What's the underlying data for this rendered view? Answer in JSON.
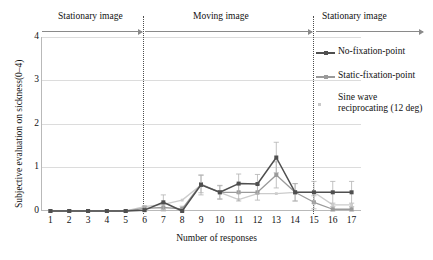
{
  "axes": {
    "ylabel": "Subjective evaluation on sickness(0–4)",
    "xlabel": "Number of responses",
    "yticks": [
      "0",
      "1",
      "2",
      "3",
      "4"
    ],
    "xticks": [
      "1",
      "2",
      "3",
      "4",
      "5",
      "6",
      "7",
      "8",
      "9",
      "10",
      "11",
      "12",
      "13",
      "14",
      "15",
      "16",
      "17"
    ]
  },
  "phases": [
    {
      "label": "Stationary image"
    },
    {
      "label": "Moving image"
    },
    {
      "label": "Stationary image"
    }
  ],
  "legend": [
    {
      "label": "No-fixation-point",
      "color": "#4f4f4f",
      "marker": "square"
    },
    {
      "label": "Static-fixation-point",
      "color": "#9a9a9a",
      "marker": "square"
    },
    {
      "label_line1": "Sine wave",
      "label_line2": "reciprocating (12 deg)",
      "label": "Sine wave reciprocating (12 deg)",
      "color": "#cccccc",
      "marker": "dot"
    }
  ],
  "colors": {
    "series1": "#4f4f4f",
    "series2": "#9a9a9a",
    "series3": "#cccccc",
    "grid": "#dcdcdc",
    "frame": "#b9b9b9",
    "divider": "#4d4d4d",
    "arrow": "#8a8a8a"
  },
  "chart_data": {
    "type": "line",
    "title": "",
    "xlabel": "Number of responses",
    "ylabel": "Subjective evaluation on sickness(0–4)",
    "xlim": [
      0.5,
      17.5
    ],
    "ylim": [
      0,
      4
    ],
    "yticks": [
      0,
      1,
      2,
      3,
      4
    ],
    "grid": true,
    "legend_position": "right-inside-top",
    "x": [
      1,
      2,
      3,
      4,
      5,
      6,
      7,
      8,
      9,
      10,
      11,
      12,
      13,
      14,
      15,
      16,
      17
    ],
    "annotations": [
      {
        "text": "Stationary image",
        "x_range": [
          1,
          5.5
        ]
      },
      {
        "text": "Moving image",
        "x_range": [
          5.5,
          13.5
        ]
      },
      {
        "text": "Stationary image",
        "x_range": [
          13.5,
          17
        ]
      }
    ],
    "vertical_dividers": [
      5.5,
      13.5
    ],
    "series": [
      {
        "name": "No-fixation-point",
        "color": "#4f4f4f",
        "values": [
          0,
          0,
          0,
          0,
          0,
          0.02,
          0.2,
          0.0,
          0.6,
          0.43,
          0.63,
          0.62,
          1.23,
          0.43,
          0.43,
          0.43,
          0.43
        ],
        "error": [
          0,
          0,
          0,
          0,
          0,
          0.08,
          0.17,
          0.0,
          0.23,
          0.16,
          0.22,
          0.22,
          0.35,
          0.2,
          0.25,
          0.25,
          0.25
        ]
      },
      {
        "name": "Static-fixation-point",
        "color": "#9a9a9a",
        "values": [
          0,
          0,
          0,
          0,
          0,
          0.06,
          0.08,
          0.05,
          0.62,
          0.43,
          0.43,
          0.43,
          0.83,
          0.43,
          0.2,
          0.04,
          0.04
        ],
        "error": [
          0,
          0,
          0,
          0,
          0,
          0.06,
          0.08,
          0.06,
          0.2,
          0.15,
          0.2,
          0.18,
          0.3,
          0.2,
          0.15,
          0.06,
          0.06
        ]
      },
      {
        "name": "Sine wave reciprocating (12 deg)",
        "color": "#cccccc",
        "values": [
          0,
          0,
          0,
          0,
          0,
          0.1,
          0.15,
          0.25,
          0.6,
          0.43,
          0.26,
          0.4,
          0.4,
          0.43,
          0.43,
          0.14,
          0.14
        ],
        "error": [
          0,
          0,
          0,
          0,
          0,
          0,
          0,
          0,
          0,
          0,
          0,
          0,
          0,
          0,
          0,
          0,
          0
        ]
      }
    ]
  }
}
